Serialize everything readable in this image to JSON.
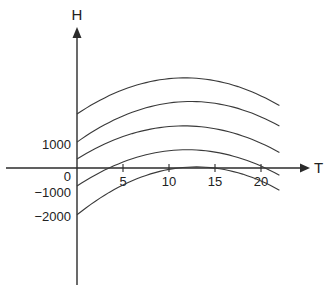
{
  "chart_data": {
    "type": "line",
    "title": "",
    "xlabel": "T",
    "ylabel": "H",
    "x_ticks": [
      5,
      10,
      15,
      20
    ],
    "y_ticks": [
      1000,
      0,
      -1000,
      -2000
    ],
    "y_tick_labels": [
      "1000",
      "0",
      "−1000",
      "−2000"
    ],
    "x_tick_labels": [
      "5",
      "10",
      "15",
      "20"
    ],
    "origin_label": "0",
    "xlim": [
      -7.8,
      25
    ],
    "ylim": [
      -4800,
      5800
    ],
    "grid": false,
    "legend": null,
    "x": [
      0,
      11,
      22
    ],
    "series": [
      {
        "name": "curve-1",
        "values": [
          2250,
          3750,
          2600
        ]
      },
      {
        "name": "curve-2",
        "values": [
          1080,
          2750,
          1750
        ]
      },
      {
        "name": "curve-3",
        "values": [
          375,
          1750,
          650
        ]
      },
      {
        "name": "curve-4",
        "values": [
          -750,
          750,
          -300
        ]
      },
      {
        "name": "curve-5",
        "values": [
          -1950,
          0,
          -925
        ]
      }
    ]
  },
  "colors": {
    "line": "#3a3a3a",
    "axis": "#2b2b2b",
    "background": "#ffffff"
  }
}
